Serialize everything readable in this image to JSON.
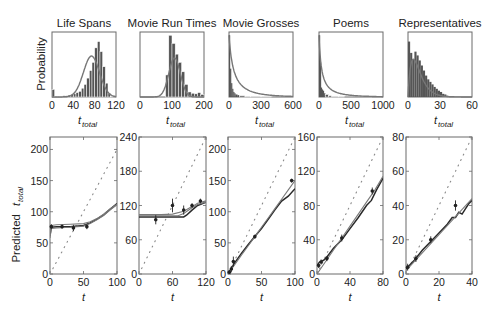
{
  "figure": {
    "top_ylabel": "Probability",
    "bottom_ylabel": "Predicted",
    "bottom_ylabel_var": "t",
    "bottom_ylabel_sub": "total",
    "top_xlabel_var": "t",
    "top_xlabel_sub": "total",
    "bottom_xlabel": "t",
    "colors": {
      "axis": "#6a6a6a",
      "bars": "#555555",
      "bar_edge": "#ffffff",
      "curve": "#777777",
      "line_dark": "#2a2a2a",
      "line_mid": "#7a7a7a",
      "dots": "#888888",
      "points": "#222222"
    }
  },
  "chart_data": [
    {
      "type": "bar",
      "title": "Life Spans",
      "xlabel": "t_total",
      "ylabel": "Probability",
      "xlim": [
        0,
        120
      ],
      "xticks": [
        0,
        40,
        80,
        120
      ],
      "bins": [
        0,
        5,
        10,
        15,
        20,
        25,
        30,
        35,
        40,
        45,
        50,
        55,
        60,
        65,
        70,
        75,
        80,
        85,
        90,
        95,
        100,
        105,
        110,
        115
      ],
      "values": [
        0.12,
        0.01,
        0.01,
        0.01,
        0.02,
        0.02,
        0.03,
        0.04,
        0.05,
        0.07,
        0.09,
        0.14,
        0.2,
        0.3,
        0.42,
        0.55,
        0.78,
        0.88,
        0.72,
        0.48,
        0.22,
        0.06,
        0.01,
        0.0
      ],
      "fit_curve": {
        "type": "gaussian",
        "mean": 74,
        "sd": 15,
        "peak": 0.65
      }
    },
    {
      "type": "bar",
      "title": "Movie Run Times",
      "xlabel": "t_total",
      "xlim": [
        0,
        200
      ],
      "xticks": [
        0,
        100,
        200
      ],
      "bins": [
        80,
        90,
        100,
        110,
        120,
        130,
        140,
        150,
        160,
        170,
        180,
        190
      ],
      "values": [
        0.35,
        0.98,
        0.85,
        0.68,
        0.55,
        0.4,
        0.2,
        0.08,
        0.06,
        0.05,
        0.07,
        0.04
      ],
      "fit_curve": {
        "type": "gaussian",
        "mean": 108,
        "sd": 18,
        "peak": 0.62
      }
    },
    {
      "type": "bar",
      "title": "Movie Grosses",
      "xlabel": "t_total",
      "xlim": [
        0,
        600
      ],
      "xticks": [
        0,
        300,
        600
      ],
      "bins": [
        0,
        10,
        20,
        30,
        40,
        50,
        60,
        80,
        100,
        150,
        200,
        300
      ],
      "values": [
        0.98,
        0.45,
        0.22,
        0.13,
        0.08,
        0.06,
        0.04,
        0.03,
        0.02,
        0.01,
        0.01,
        0.005
      ],
      "fit_curve": {
        "type": "powerlaw",
        "decay": 0.075
      }
    },
    {
      "type": "bar",
      "title": "Poems",
      "xlabel": "t_total",
      "xlim": [
        0,
        1000
      ],
      "xticks": [
        0,
        500,
        1000
      ],
      "bins": [
        0,
        15,
        30,
        45,
        60,
        80,
        100,
        150,
        200,
        300
      ],
      "values": [
        0.98,
        0.55,
        0.15,
        0.12,
        0.1,
        0.06,
        0.04,
        0.02,
        0.01,
        0.005
      ],
      "fit_curve": {
        "type": "powerlaw",
        "decay": 0.04
      }
    },
    {
      "type": "bar",
      "title": "Representatives",
      "xlabel": "t_total",
      "xlim": [
        0,
        60
      ],
      "xticks": [
        0,
        30,
        60
      ],
      "bins": [
        0,
        2,
        4,
        6,
        8,
        10,
        12,
        14,
        16,
        18,
        20,
        22,
        24,
        26,
        28,
        30,
        32,
        34,
        36,
        38
      ],
      "values": [
        0.88,
        0.7,
        0.6,
        0.72,
        0.66,
        0.58,
        0.5,
        0.42,
        0.34,
        0.28,
        0.24,
        0.2,
        0.16,
        0.13,
        0.1,
        0.08,
        0.05,
        0.04,
        0.02,
        0.01
      ],
      "fit_curve": {
        "type": "erlang",
        "peak_x": 5,
        "peak": 0.6
      }
    },
    {
      "type": "line",
      "panel": "Life Spans",
      "xlabel": "t",
      "ylabel": "Predicted t_total",
      "xlim": [
        0,
        100
      ],
      "ylim": [
        0,
        220
      ],
      "xticks": [
        0,
        50,
        100
      ],
      "yticks": [
        0,
        50,
        100,
        150,
        200
      ],
      "diagonal": {
        "x": [
          0,
          100
        ],
        "y": [
          0,
          200
        ]
      },
      "series": [
        {
          "name": "model",
          "x": [
            0,
            2,
            10,
            30,
            50,
            60,
            70,
            80,
            90,
            100
          ],
          "y": [
            62,
            75,
            76,
            76,
            78,
            82,
            88,
            95,
            104,
            113
          ]
        },
        {
          "name": "model_alt",
          "x": [
            0,
            2,
            10,
            30,
            50,
            60,
            70,
            80,
            90,
            100
          ],
          "y": [
            66,
            78,
            79,
            80,
            81,
            84,
            89,
            96,
            105,
            112
          ]
        },
        {
          "name": "model_alt2",
          "x": [
            0,
            2,
            10,
            30,
            50,
            60,
            70,
            80,
            90,
            100
          ],
          "y": [
            58,
            73,
            74,
            75,
            77,
            81,
            87,
            94,
            103,
            111
          ]
        }
      ],
      "points": {
        "x": [
          2,
          18,
          35,
          55
        ],
        "y": [
          76,
          76,
          74,
          76
        ],
        "err": [
          4,
          3,
          5,
          4
        ]
      }
    },
    {
      "type": "line",
      "panel": "Movie Run Times",
      "xlabel": "t",
      "xlim": [
        0,
        120
      ],
      "ylim": [
        0,
        240
      ],
      "xticks": [
        0,
        60,
        120
      ],
      "yticks": [
        0,
        60,
        120,
        180,
        240
      ],
      "diagonal": {
        "x": [
          0,
          120
        ],
        "y": [
          0,
          240
        ]
      },
      "series": [
        {
          "name": "model",
          "x": [
            0,
            40,
            80,
            85,
            95,
            105,
            120
          ],
          "y": [
            100,
            100,
            100,
            103,
            112,
            120,
            126
          ]
        },
        {
          "name": "model_alt",
          "x": [
            0,
            40,
            70,
            80,
            95,
            105,
            120
          ],
          "y": [
            102,
            102,
            102,
            106,
            116,
            122,
            126
          ]
        },
        {
          "name": "model_alt2",
          "x": [
            0,
            40,
            60,
            80,
            95,
            105,
            120
          ],
          "y": [
            104,
            104,
            105,
            110,
            118,
            124,
            128
          ]
        }
      ],
      "points": {
        "x": [
          30,
          60,
          80,
          95,
          110
        ],
        "y": [
          95,
          120,
          112,
          120,
          128
        ],
        "err": [
          8,
          12,
          8,
          4,
          4
        ]
      }
    },
    {
      "type": "line",
      "panel": "Movie Grosses",
      "xlabel": "t",
      "xlim": [
        0,
        100
      ],
      "ylim": [
        0,
        220
      ],
      "xticks": [
        0,
        50,
        100
      ],
      "yticks": [
        0,
        50,
        100,
        150,
        200
      ],
      "diagonal": {
        "x": [
          0,
          100
        ],
        "y": [
          0,
          220
        ]
      },
      "series": [
        {
          "name": "model",
          "x": [
            0,
            10,
            20,
            30,
            40,
            50,
            60,
            70,
            80,
            90,
            100
          ],
          "y": [
            0,
            18,
            33,
            47,
            60,
            73,
            88,
            103,
            117,
            125,
            137
          ]
        },
        {
          "name": "model_alt",
          "x": [
            0,
            10,
            20,
            30,
            40,
            50,
            60,
            70,
            80,
            90,
            100
          ],
          "y": [
            0,
            15,
            30,
            45,
            60,
            75,
            90,
            105,
            120,
            135,
            150
          ]
        }
      ],
      "points": {
        "x": [
          2,
          5,
          8,
          40,
          95
        ],
        "y": [
          3,
          8,
          20,
          60,
          150
        ],
        "err": [
          3,
          5,
          8,
          3,
          3
        ]
      }
    },
    {
      "type": "line",
      "panel": "Poems",
      "xlabel": "t",
      "xlim": [
        0,
        80
      ],
      "ylim": [
        0,
        160
      ],
      "xticks": [
        0,
        40,
        80
      ],
      "yticks": [
        0,
        40,
        80,
        120,
        160
      ],
      "diagonal": {
        "x": [
          0,
          80
        ],
        "y": [
          0,
          160
        ]
      },
      "series": [
        {
          "name": "model",
          "x": [
            0,
            3,
            8,
            12,
            20,
            30,
            40,
            50,
            60,
            66,
            72,
            80
          ],
          "y": [
            10,
            14,
            16,
            20,
            30,
            40,
            53,
            66,
            80,
            86,
            98,
            112
          ]
        },
        {
          "name": "model_alt",
          "x": [
            0,
            10,
            20,
            30,
            40,
            50,
            60,
            70,
            80
          ],
          "y": [
            0,
            14,
            28,
            42,
            56,
            70,
            84,
            98,
            114
          ]
        }
      ],
      "points": {
        "x": [
          2,
          5,
          12,
          30,
          67
        ],
        "y": [
          10,
          14,
          18,
          42,
          97
        ],
        "err": [
          3,
          3,
          3,
          4,
          4
        ]
      }
    },
    {
      "type": "line",
      "panel": "Representatives",
      "xlabel": "t",
      "xlim": [
        0,
        40
      ],
      "ylim": [
        0,
        80
      ],
      "xticks": [
        0,
        20,
        40
      ],
      "yticks": [
        0,
        20,
        40,
        60,
        80
      ],
      "diagonal": {
        "x": [
          0,
          40
        ],
        "y": [
          0,
          80
        ]
      },
      "series": [
        {
          "name": "model",
          "x": [
            0,
            5,
            10,
            15,
            20,
            25,
            28,
            30,
            32,
            34,
            36,
            38,
            40
          ],
          "y": [
            3,
            8,
            14,
            19,
            24,
            29,
            33,
            33,
            36,
            35,
            38,
            41,
            43
          ]
        },
        {
          "name": "model_alt",
          "x": [
            0,
            10,
            20,
            30,
            40
          ],
          "y": [
            2,
            12.5,
            23,
            33.5,
            44
          ]
        }
      ],
      "points": {
        "x": [
          1,
          6,
          15,
          30
        ],
        "y": [
          4,
          9,
          20,
          40
        ],
        "err": [
          2,
          2,
          2,
          3
        ]
      }
    }
  ]
}
